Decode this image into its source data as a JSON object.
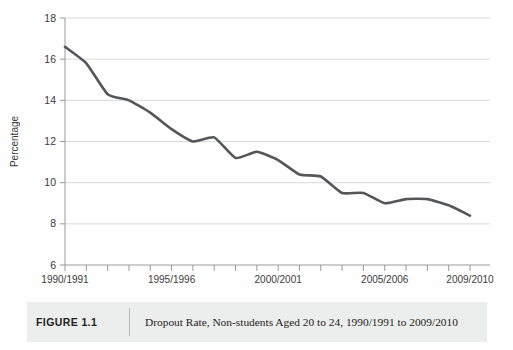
{
  "figure": {
    "caption_label": "FIGURE 1.1",
    "caption_text": "Dropout Rate, Non-students Aged 20 to 24, 1990/1991 to 2009/2010"
  },
  "chart_data": {
    "type": "line",
    "title": "Dropout Rate, Non-students Aged 20 to 24, 1990/1991 to 2009/2010",
    "xlabel": "",
    "ylabel": "Percentage",
    "x": [
      "1990/1991",
      "1991/1992",
      "1992/1993",
      "1993/1994",
      "1994/1995",
      "1995/1996",
      "1996/1997",
      "1997/1998",
      "1998/1999",
      "1999/2000",
      "2000/2001",
      "2001/2002",
      "2002/2003",
      "2003/2004",
      "2004/2005",
      "2005/2006",
      "2006/2007",
      "2007/2008",
      "2008/2009",
      "2009/2010"
    ],
    "values": [
      16.6,
      15.8,
      14.3,
      14.0,
      13.4,
      12.6,
      12.0,
      12.2,
      11.2,
      11.5,
      11.1,
      10.4,
      10.3,
      9.5,
      9.5,
      9.0,
      9.2,
      9.2,
      8.9,
      8.4
    ],
    "ylim": [
      6,
      18
    ],
    "yticks": [
      6,
      8,
      10,
      12,
      14,
      16,
      18
    ],
    "ytick_labels": [
      "6",
      "8",
      "10",
      "12",
      "14",
      "16",
      "18"
    ],
    "xtick_labels_shown": [
      "1990/1991",
      "1995/1996",
      "2000/2001",
      "2005/2006",
      "2009/2010"
    ],
    "xtick_label_indices": [
      0,
      5,
      10,
      15,
      19
    ],
    "grid": "horizontal",
    "legend": "none",
    "line_color": "#55565a",
    "grid_color": "#d9dadb",
    "axis_color": "#9a9b9e"
  }
}
